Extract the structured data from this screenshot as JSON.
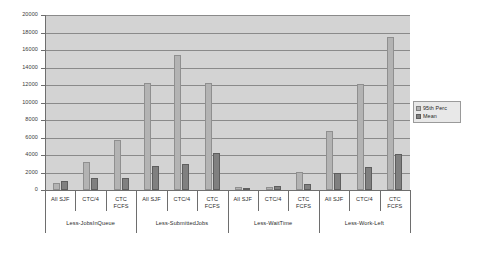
{
  "chart_data": {
    "type": "bar",
    "title": "",
    "subtitle": "",
    "xlabel": "",
    "ylabel": "",
    "ylim": [
      0,
      20000
    ],
    "ytick_step": 2000,
    "yticks": [
      "0",
      "2000",
      "4000",
      "6000",
      "8000",
      "10000",
      "12000",
      "14000",
      "16000",
      "18000",
      "20000"
    ],
    "grid": true,
    "legend_position": "right",
    "categories": [
      "All SJF",
      "CTC/4",
      "CTC\nFCFS",
      "All SJF",
      "CTC/4",
      "CTC\nFCFS",
      "All SJF",
      "CTC/4",
      "CTC\nFCFS",
      "All SJF",
      "CTC/4",
      "CTC\nFCFS"
    ],
    "groups": [
      {
        "name": "Less-JobsInQueue",
        "categories": [
          "All SJF",
          "CTC/4",
          "CTC\nFCFS"
        ],
        "values_95th": [
          800,
          3200,
          5700
        ],
        "values_mean": [
          1000,
          1400,
          1400
        ]
      },
      {
        "name": "Less-SubmittedJobs",
        "categories": [
          "All SJF",
          "CTC/4",
          "CTC\nFCFS"
        ],
        "values_95th": [
          12200,
          15400,
          12200
        ],
        "values_mean": [
          2800,
          3000,
          4200
        ]
      },
      {
        "name": "Less-WaitTime",
        "categories": [
          "All SJF",
          "CTC/4",
          "CTC\nFCFS"
        ],
        "values_95th": [
          400,
          350,
          2100
        ],
        "values_mean": [
          200,
          500,
          700
        ]
      },
      {
        "name": "Less-Work-Left",
        "categories": [
          "All SJF",
          "CTC/4",
          "CTC\nFCFS"
        ],
        "values_95th": [
          6700,
          12100,
          17500
        ],
        "values_mean": [
          2000,
          2600,
          4100
        ]
      }
    ],
    "series": [
      {
        "name": "95th Perc",
        "color": "#b3b3b3",
        "values": [
          800,
          3200,
          5700,
          12200,
          15400,
          12200,
          400,
          350,
          2100,
          6700,
          12100,
          17500
        ]
      },
      {
        "name": "Mean",
        "color": "#808080",
        "values": [
          1000,
          1400,
          1400,
          2800,
          3000,
          4200,
          200,
          500,
          700,
          2000,
          2600,
          4100
        ]
      }
    ]
  },
  "legend": {
    "entries": [
      {
        "label": "95th Perc"
      },
      {
        "label": "Mean"
      }
    ]
  },
  "colors": {
    "plot_background": "#d3d3d3",
    "gridline": "#8a8a8a",
    "axis": "#6e6e6e",
    "series_95th": "#b3b3b3",
    "series_mean": "#808080"
  }
}
